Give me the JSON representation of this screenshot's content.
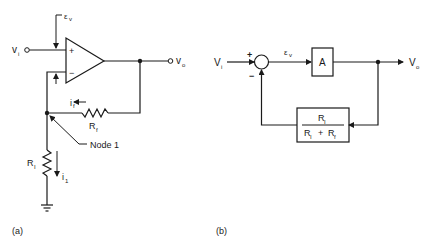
{
  "figure": {
    "panel_a": {
      "caption": "(a)",
      "labels": {
        "vi": "v",
        "vi_sub": "i",
        "vo": "v",
        "vo_sub": "o",
        "ev": "ε",
        "ev_sub": "v",
        "plus": "+",
        "minus": "−",
        "if": "i",
        "if_sub": "f",
        "rf": "R",
        "rf_sub": "f",
        "r1": "R",
        "r1_sub": "I",
        "i1": "i",
        "i1_sub": "1",
        "node": "Node 1"
      }
    },
    "panel_b": {
      "caption": "(b)",
      "labels": {
        "vi": "V",
        "vi_sub": "i",
        "vo": "V",
        "vo_sub": "o",
        "ev": "ε",
        "ev_sub": "v",
        "plus": "+",
        "minus": "−",
        "gain": "A",
        "fb_num": "R",
        "fb_num_sub": "I",
        "fb_den_a": "R",
        "fb_den_a_sub": "I",
        "fb_plus": "+",
        "fb_den_b": "R",
        "fb_den_b_sub": "f"
      }
    }
  }
}
